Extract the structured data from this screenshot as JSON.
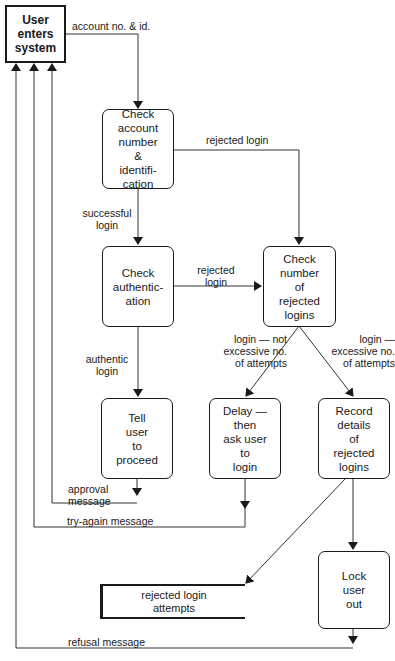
{
  "diagram": {
    "type": "data-flow-diagram",
    "nodes": {
      "start": {
        "label": "User\nenters\nsystem"
      },
      "check_account": {
        "label": "Check\naccount\nnumber\n&\nidentifi-\ncation"
      },
      "check_auth": {
        "label": "Check\nauthentic-\nation"
      },
      "check_rejected": {
        "label": "Check\nnumber\nof\nrejected\nlogins"
      },
      "tell_user": {
        "label": "Tell\nuser\nto\nproceed"
      },
      "delay": {
        "label": "Delay —\nthen\nask user\nto\nlogin"
      },
      "record": {
        "label": "Record\ndetails\nof\nrejected\nlogins"
      },
      "lock": {
        "label": "Lock\nuser\nout"
      },
      "store": {
        "label": "rejected login\nattempts"
      }
    },
    "edges": {
      "account_id": "account no. & id.",
      "rejected_login_1": "rejected login",
      "successful_login": "successful\nlogin",
      "rejected_login_2": "rejected\nlogin",
      "authentic_login": "authentic\nlogin",
      "not_excessive": "login —  not\nexcessive no.\nof  attempts",
      "excessive": "login —\nexcessive no.\nof  attempts",
      "approval": "approval\nmessage",
      "try_again": "try-again message",
      "refusal": "refusal message"
    }
  }
}
